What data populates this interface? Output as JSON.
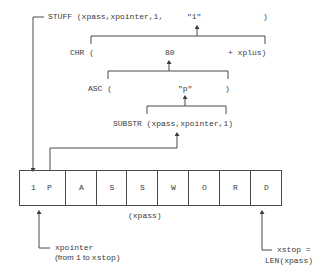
{
  "expressions": {
    "stuff": {
      "func": "STUFF (xpass,xpointer,1,",
      "value": "\"1\"",
      "close": ")"
    },
    "chr": {
      "func": "CHR (",
      "value": "80",
      "close": "+ xplus)"
    },
    "asc": {
      "func": "ASC (",
      "value": "\"p\"",
      "close": ")"
    },
    "substr": {
      "call": "SUBSTR (xpass,xpointer,1)"
    }
  },
  "string_array": {
    "cells": [
      "1",
      "P",
      "A",
      "S",
      "S",
      "W",
      "O",
      "R",
      "D"
    ],
    "label": "(xpass)"
  },
  "annotations": {
    "xpointer_line1": "xpointer",
    "xpointer_line2_prefix": "(from ",
    "xpointer_line2_mid": "1",
    "xpointer_line2_to": " to ",
    "xpointer_line2_end": "xstop)",
    "xstop_line1": "xstop =",
    "xstop_line2": "LEN(xpass)"
  },
  "colors": {
    "line": "#4a4a4a",
    "text": "#3a3a3a",
    "background": "#ffffff"
  }
}
